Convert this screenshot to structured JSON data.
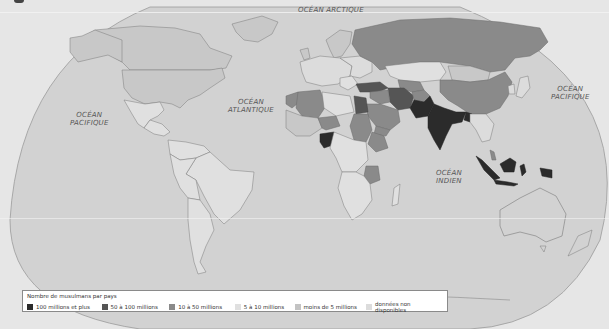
{
  "map": {
    "type": "choropleth",
    "subject": "Nombre de musulmans par pays",
    "projection": "world map (elliptical)",
    "colors": {
      "background": "#e6e6e6",
      "ocean": "#d2d2d2",
      "border": "#7a7a7a",
      "100_plus": "#2b2b2b",
      "50_100": "#555555",
      "10_50": "#8a8a8a",
      "5_10": "#e0e0e0",
      "under_5": "#c3c3c3",
      "no_data": "#dcdcdc"
    },
    "ocean_labels": [
      {
        "id": "arctic",
        "lines": [
          "OCÉAN ARCTIQUE"
        ]
      },
      {
        "id": "pacific-west",
        "lines": [
          "OCÉAN",
          "PACIFIQUE"
        ]
      },
      {
        "id": "atlantic",
        "lines": [
          "OCÉAN",
          "ATLANTIQUE"
        ]
      },
      {
        "id": "pacific-east",
        "lines": [
          "OCÉAN",
          "PACIFIQUE"
        ]
      },
      {
        "id": "indian",
        "lines": [
          "OCÉAN",
          "INDIEN"
        ]
      }
    ],
    "highlighted_countries": {
      "100_millions_et_plus": [
        "Pakistan",
        "India",
        "Bangladesh",
        "Indonesia",
        "Nigeria"
      ],
      "50_a_100_millions": [
        "Egypt",
        "Iran",
        "Turkey"
      ],
      "10_a_50_millions": [
        "Algeria",
        "Morocco",
        "Sudan",
        "Saudi Arabia",
        "Iraq",
        "Afghanistan",
        "Ethiopia",
        "Tanzania",
        "Russia",
        "China",
        "Niger",
        "Mali",
        "Uzbekistan",
        "Yemen",
        "Syria"
      ]
    }
  },
  "legend": {
    "title": "Nombre de musulmans par pays",
    "items": [
      {
        "label": "100 millions et plus",
        "color": "#2b2b2b"
      },
      {
        "label": "50 à 100 millions",
        "color": "#555555"
      },
      {
        "label": "10 à 50 millions",
        "color": "#8a8a8a"
      },
      {
        "label": "5 à 10 millions",
        "color": "#e0e0e0"
      },
      {
        "label": "moins de 5 millions",
        "color": "#c3c3c3"
      },
      {
        "label": "données non disponibles",
        "color": "#dcdcdc"
      }
    ]
  }
}
